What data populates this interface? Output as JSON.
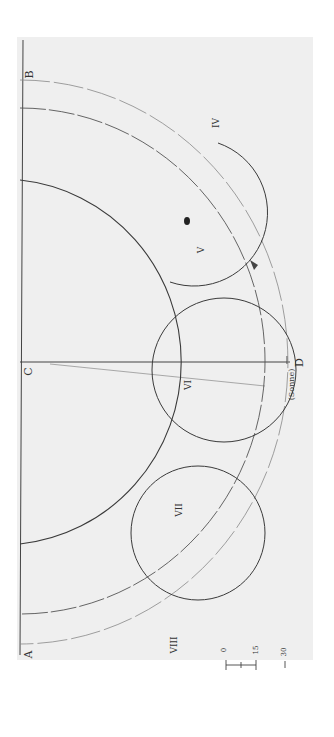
{
  "diagram": {
    "labels": {
      "A": "A",
      "B": "B",
      "C": "C",
      "D": "D",
      "IV": "IV",
      "V": "V",
      "VI": "VI",
      "VII": "VII",
      "VIII": "VIII",
      "annotation_near_D": "(Sonne)"
    },
    "scale_bar": {
      "tick_0": "0",
      "tick_15": "15",
      "tick_30": "30"
    },
    "colors": {
      "paper": "#efefef",
      "ink": "#3a3a3a",
      "faint_ink": "#9a9a9a",
      "background": "#ffffff"
    }
  }
}
